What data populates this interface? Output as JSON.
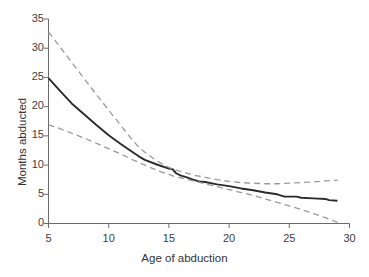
{
  "chart_data": {
    "type": "line",
    "title": "",
    "subtitle": "",
    "xlabel": "Age of abduction",
    "ylabel": "Months abducted",
    "xlim": [
      5,
      30
    ],
    "ylim": [
      0,
      35
    ],
    "xticks": [
      5,
      10,
      15,
      20,
      25,
      30
    ],
    "yticks": [
      0,
      5,
      10,
      15,
      20,
      25,
      30,
      35
    ],
    "xtick_labels": [
      "5",
      "10",
      "15",
      "20",
      "25",
      "30"
    ],
    "ytick_labels": [
      "0",
      "5",
      "10",
      "15",
      "20",
      "25",
      "30",
      "35"
    ],
    "grid": false,
    "legend": "none",
    "annotations": [],
    "series": [
      {
        "name": "Estimate",
        "style": "solid",
        "color": "#2b2b2b",
        "width": 1.9,
        "x": [
          5,
          6,
          7,
          7.5,
          8,
          9,
          10,
          11,
          12,
          12.5,
          13,
          14,
          15,
          15.3,
          15.6,
          16,
          16.5,
          17,
          17.5,
          18,
          19,
          20,
          21,
          22,
          23,
          24,
          24.6,
          25,
          25.6,
          26,
          27,
          28,
          28.3,
          29
        ],
        "values": [
          24.9,
          22.6,
          20.4,
          19.5,
          18.6,
          16.8,
          15.1,
          13.6,
          12.2,
          11.5,
          10.9,
          10.1,
          9.4,
          9.3,
          8.6,
          8.2,
          7.9,
          7.5,
          7.2,
          7.1,
          6.7,
          6.4,
          6.0,
          5.7,
          5.3,
          5.0,
          4.6,
          4.6,
          4.6,
          4.4,
          4.3,
          4.2,
          4.0,
          3.9
        ]
      },
      {
        "name": "Upper 95% confidence limit",
        "style": "dashed",
        "color": "#9a9a9a",
        "width": 1.3,
        "x": [
          5,
          6,
          7,
          8,
          9,
          10,
          11,
          12,
          12.5,
          13,
          14,
          15,
          15.5,
          16,
          17,
          18,
          19,
          20,
          21,
          22,
          23,
          24,
          25,
          26,
          27,
          28,
          29
        ],
        "values": [
          32.8,
          30.1,
          27.4,
          24.7,
          22.0,
          19.4,
          16.8,
          14.2,
          13.1,
          12.2,
          10.7,
          9.6,
          9.2,
          8.9,
          8.3,
          7.9,
          7.5,
          7.2,
          7.0,
          6.9,
          6.8,
          6.8,
          6.9,
          7.0,
          7.1,
          7.3,
          7.4
        ]
      },
      {
        "name": "Lower 95% confidence limit",
        "style": "dashed",
        "color": "#9a9a9a",
        "width": 1.3,
        "x": [
          5,
          6,
          7,
          8,
          9,
          10,
          11,
          12,
          13,
          14,
          15,
          15.5,
          16,
          17,
          18,
          19,
          20,
          21,
          22,
          23,
          24,
          25,
          26,
          27,
          28,
          29
        ],
        "values": [
          16.9,
          16.2,
          15.4,
          14.6,
          13.7,
          12.8,
          11.9,
          10.9,
          10.0,
          9.1,
          8.4,
          8.0,
          7.8,
          7.3,
          6.8,
          6.3,
          5.8,
          5.3,
          4.8,
          4.2,
          3.6,
          3.0,
          2.4,
          1.7,
          1.0,
          0.2
        ]
      }
    ]
  },
  "axes": {
    "axis_color": "#6b6b6b",
    "tick_color": "#6b6b6b"
  }
}
